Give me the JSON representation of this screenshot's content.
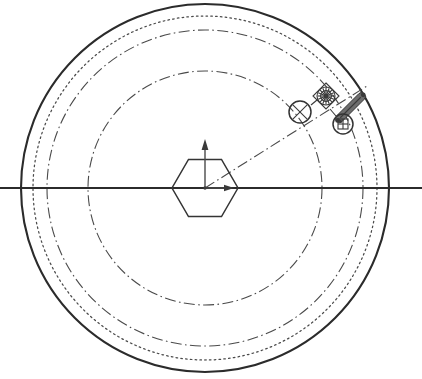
{
  "drawing": {
    "title": "Rotary Drum Sectional Layout",
    "type": "engineering-line-drawing",
    "canvas": {
      "width": 422,
      "height": 379,
      "background": "#ffffff"
    },
    "center": {
      "x": 205,
      "y": 188
    },
    "colors": {
      "line_heavy": "#2b2b2b",
      "line_medium": "#343434",
      "line_light": "#4a4a4a",
      "fill_dark": "#3a3a3a",
      "fill_mid": "#6e6e6e",
      "background": "#ffffff"
    }
  },
  "circles": [
    {
      "name": "outer-shell-circle",
      "radius": 184,
      "style": "solid-heavy",
      "label": "Outer shell boundary"
    },
    {
      "name": "dotted-track-circle",
      "radius": 172,
      "style": "dotted",
      "label": "Hidden track path"
    },
    {
      "name": "outer-pitch-circle",
      "radius": 158,
      "style": "dash-dot",
      "label": "Outer pitch circle"
    },
    {
      "name": "inner-pitch-circle",
      "radius": 117,
      "style": "dash-dot",
      "label": "Inner pitch circle"
    }
  ],
  "centerline": {
    "name": "horizontal-centerline",
    "style": "solid-center",
    "x_start": 0,
    "x_end": 422,
    "y": 188
  },
  "radial_line": {
    "name": "radial-centerline",
    "style": "dash-dot",
    "angle_deg": -34,
    "from": {
      "x": 205,
      "y": 188
    },
    "to": {
      "x": 367,
      "y": 86
    }
  },
  "hexagon": {
    "name": "central-hub-hexagon",
    "center": {
      "x": 205,
      "y": 188
    },
    "circumradius": 33,
    "orientation": "pointy-side",
    "style": "solid-medium"
  },
  "axis_arrows": [
    {
      "name": "vertical-axis-arrow",
      "direction": "up",
      "from": {
        "x": 205,
        "y": 188
      },
      "to": {
        "x": 205,
        "y": 143
      }
    },
    {
      "name": "horizontal-axis-arrow",
      "direction": "right",
      "from": {
        "x": 205,
        "y": 188
      },
      "to": {
        "x": 232,
        "y": 188
      }
    }
  ],
  "components": [
    {
      "name": "crossed-circle-symbol",
      "kind": "x-in-circle",
      "center": {
        "x": 300,
        "y": 112
      },
      "radius": 11,
      "description": "Crossed circle datum / roller marker"
    },
    {
      "name": "sprocket-gear-symbol",
      "kind": "gear-in-diamond",
      "center": {
        "x": 326,
        "y": 96
      },
      "radius": 9,
      "diamond_half": 13,
      "teeth": 12,
      "description": "Toothed sprocket within diamond bracket"
    },
    {
      "name": "linkage-rod",
      "kind": "angled-cylinder",
      "from": {
        "x": 337,
        "y": 121
      },
      "to": {
        "x": 364,
        "y": 94
      },
      "thickness": 7,
      "description": "Angled actuator rod / cylinder link"
    },
    {
      "name": "square-in-circle-symbol",
      "kind": "square-in-circle",
      "center": {
        "x": 343,
        "y": 124
      },
      "radius": 10,
      "square_half": 5,
      "description": "Pivot bearing with square key"
    },
    {
      "name": "connector-stub-upper",
      "kind": "short-line",
      "from": {
        "x": 311,
        "y": 105
      },
      "to": {
        "x": 316,
        "y": 101
      }
    },
    {
      "name": "connector-stub-lower",
      "kind": "short-line",
      "from": {
        "x": 330,
        "y": 110
      },
      "to": {
        "x": 336,
        "y": 116
      }
    }
  ]
}
